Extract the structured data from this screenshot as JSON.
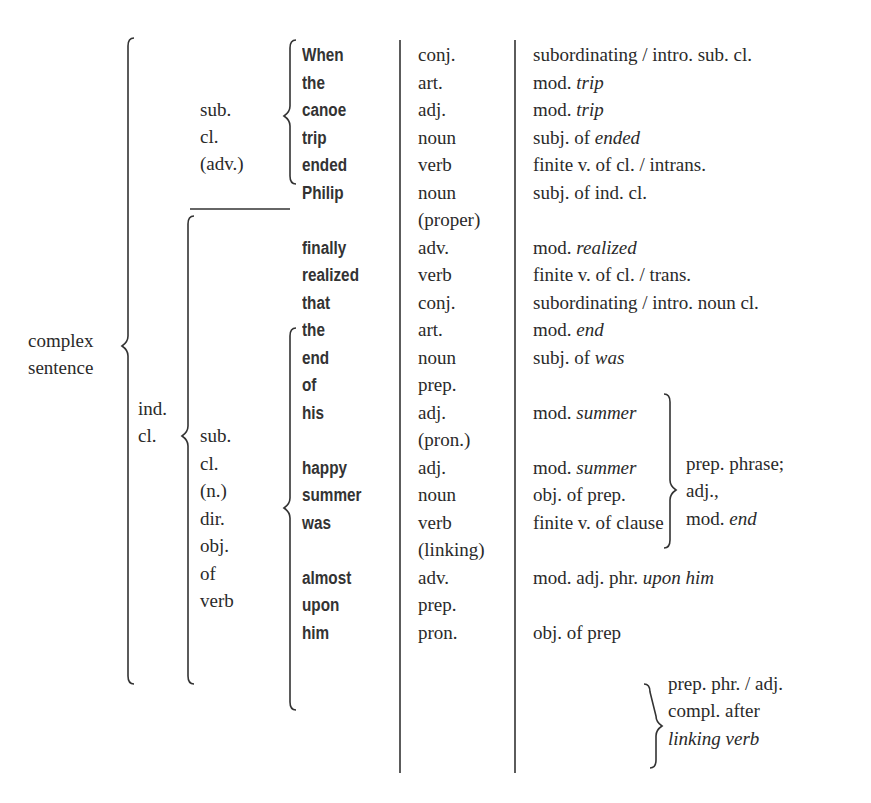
{
  "diagram": {
    "root_label": [
      "complex",
      "sentence"
    ],
    "sub_clause_adv_label": [
      "sub.",
      "cl.",
      "(adv.)"
    ],
    "ind_clause_label": [
      "ind.",
      "cl."
    ],
    "sub_clause_noun_label": [
      "sub.",
      "cl.",
      "(n.)",
      "dir.",
      "obj.",
      "of",
      "verb"
    ],
    "rows": [
      {
        "word": "When",
        "pos": "conj.",
        "func": "subordinating / intro. sub. cl."
      },
      {
        "word": "the",
        "pos": "art.",
        "func": "mod. ",
        "func_i": "trip"
      },
      {
        "word": "canoe",
        "pos": "adj.",
        "func": "mod. ",
        "func_i": "trip"
      },
      {
        "word": "trip",
        "pos": "noun",
        "func": "subj. of ",
        "func_i": "ended"
      },
      {
        "word": "ended",
        "pos": "verb",
        "func": "finite v. of cl. / intrans."
      },
      {
        "word": "Philip",
        "pos": "noun",
        "func": "subj. of ind. cl."
      },
      {
        "word": "",
        "pos": "(proper)",
        "func": ""
      },
      {
        "word": "finally",
        "pos": "adv.",
        "func": "mod. ",
        "func_i": "realized"
      },
      {
        "word": "realized",
        "pos": "verb",
        "func": "finite v. of cl. / trans."
      },
      {
        "word": "that",
        "pos": "conj.",
        "func": "subordinating / intro. noun cl."
      },
      {
        "word": "the",
        "pos": "art.",
        "func": "mod. ",
        "func_i": "end"
      },
      {
        "word": "end",
        "pos": "noun",
        "func": "subj. of ",
        "func_i": "was"
      },
      {
        "word": "of",
        "pos": "prep.",
        "func": ""
      },
      {
        "word": "his",
        "pos": "adj.",
        "func": "mod. ",
        "func_i": "summer"
      },
      {
        "word": "",
        "pos": "(pron.)",
        "func": ""
      },
      {
        "word": "happy",
        "pos": "adj.",
        "func": "mod. ",
        "func_i": "summer"
      },
      {
        "word": "summer",
        "pos": "noun",
        "func": "obj. of prep."
      },
      {
        "word": "was",
        "pos": "verb",
        "func": "finite v. of clause"
      },
      {
        "word": "",
        "pos": "(linking)",
        "func": ""
      },
      {
        "word": "almost",
        "pos": "adv.",
        "func": "mod. adj. phr. ",
        "func_i": "upon him"
      },
      {
        "word": "upon",
        "pos": "prep.",
        "func": ""
      },
      {
        "word": "him",
        "pos": "pron.",
        "func": "obj. of prep"
      }
    ],
    "group_prep_phrase": {
      "lines": [
        "prep. phrase;",
        "adj.,",
        "mod. "
      ],
      "last_italic": "end"
    },
    "group_upon_him": {
      "lines": [
        "prep. phr. / adj.",
        "compl. after"
      ],
      "italic_line": "linking verb"
    }
  }
}
